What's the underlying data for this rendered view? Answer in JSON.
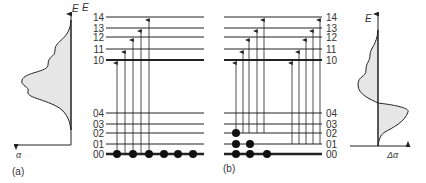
{
  "panel_a": {
    "label": "(a)",
    "x_axis": "α",
    "y_axis": "E"
  },
  "panel_b": {
    "label": "(b)",
    "x_axis": "Δα",
    "y_axis": "E"
  },
  "levels_upper": [
    "14",
    "13",
    "12",
    "11",
    "10"
  ],
  "levels_lower": [
    "04",
    "03",
    "02",
    "01",
    "00"
  ],
  "colors": {
    "line": "#222222",
    "fill": "#e6e6e6"
  }
}
